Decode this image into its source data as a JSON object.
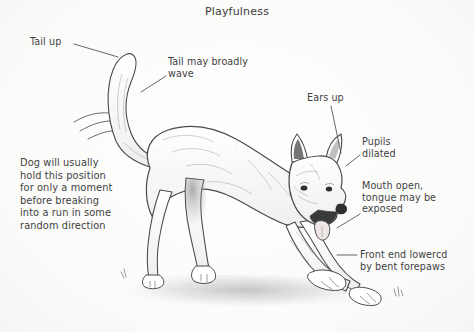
{
  "figure": {
    "title": "Playfulness",
    "background_color": "#fbfbfa",
    "ink_color": "#3f3f3f",
    "text_color": "#3f3f3f"
  },
  "annotations": {
    "tail_up": "Tail up",
    "tail_wave": "Tail may broadly\nwave",
    "ears_up": "Ears up",
    "pupils_dilated": "Pupils\ndilated",
    "mouth_open": "Mouth open,\ntongue may be\nexposed",
    "front_end_lowered": "Front end lowercd\nby bent forepaws",
    "hold_position": "Dog will usually\nhold this position\nfor only a moment\nbefore breaking\ninto a run in some\nrandom direction"
  }
}
